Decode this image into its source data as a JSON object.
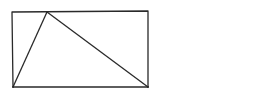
{
  "diagram": {
    "stroke_color": "#2a2a2a",
    "background": "#ffffff",
    "rectangle": {
      "x1": 12,
      "y1": 12,
      "x2": 148,
      "y2": 87
    },
    "triangle": {
      "apex": [
        47,
        12
      ],
      "bottom_left": [
        13,
        87
      ],
      "bottom_right": [
        148,
        87
      ]
    },
    "labels": []
  }
}
